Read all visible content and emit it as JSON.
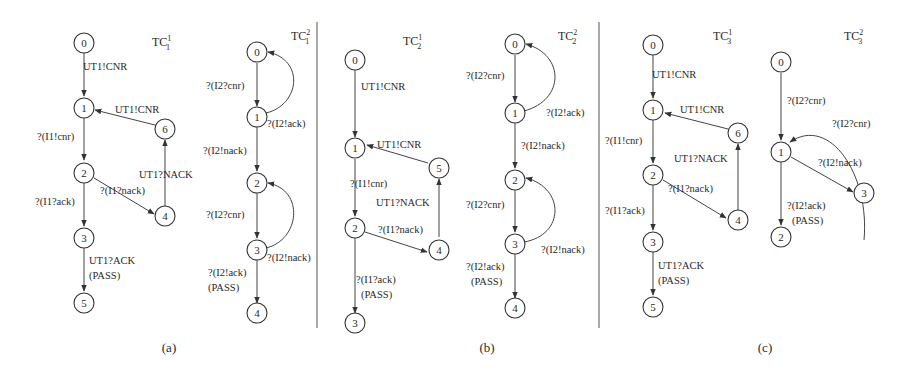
{
  "figure": {
    "panels": [
      {
        "id": "a",
        "caption": "(a)"
      },
      {
        "id": "b",
        "caption": "(b)"
      },
      {
        "id": "c",
        "caption": "(c)"
      }
    ],
    "graphs": {
      "tc11": {
        "title": "TC",
        "sup": "1",
        "sub": "1",
        "nodes": [
          "0",
          "1",
          "2",
          "3",
          "4",
          "5",
          "6"
        ],
        "edges": [
          {
            "from": "0",
            "to": "1",
            "label": "UT1!CNR"
          },
          {
            "from": "1",
            "to": "2",
            "label": "?(I1!cnr)"
          },
          {
            "from": "2",
            "to": "3",
            "label": "?(I1?ack)"
          },
          {
            "from": "2",
            "to": "4",
            "label": "?(I1?nack)"
          },
          {
            "from": "4",
            "to": "6",
            "label": "UT1?NACK"
          },
          {
            "from": "6",
            "to": "1",
            "label": "UT1!CNR"
          },
          {
            "from": "3",
            "to": "5",
            "label": "UT1?ACK",
            "label2": "(PASS)"
          }
        ]
      },
      "tc12": {
        "title": "TC",
        "sup": "2",
        "sub": "1",
        "nodes": [
          "0",
          "1",
          "2",
          "3",
          "4"
        ],
        "edges": [
          {
            "from": "0",
            "to": "1",
            "label": "?(I2?cnr)"
          },
          {
            "from": "1",
            "to": "0",
            "label": "?(I2!ack)"
          },
          {
            "from": "1",
            "to": "2",
            "label": "?(I2!nack)"
          },
          {
            "from": "2",
            "to": "3",
            "label": "?(I2?cnr)"
          },
          {
            "from": "3",
            "to": "2",
            "label": "?(I2!nack)"
          },
          {
            "from": "3",
            "to": "4",
            "label": "?(I2!ack)",
            "label2": "(PASS)"
          }
        ]
      },
      "tc21": {
        "title": "TC",
        "sup": "1",
        "sub": "2",
        "nodes": [
          "0",
          "1",
          "2",
          "3",
          "4",
          "5"
        ],
        "edges": [
          {
            "from": "0",
            "to": "1",
            "label": "UT1!CNR"
          },
          {
            "from": "1",
            "to": "2",
            "label": "?(I1!cnr)"
          },
          {
            "from": "2",
            "to": "4",
            "label": "?(I1?nack)"
          },
          {
            "from": "4",
            "to": "5",
            "label": "UT1?NACK"
          },
          {
            "from": "5",
            "to": "1",
            "label": "UT1!CNR"
          },
          {
            "from": "2",
            "to": "3",
            "label": "?(I1?ack)",
            "label2": "(PASS)"
          }
        ]
      },
      "tc22": {
        "title": "TC",
        "sup": "2",
        "sub": "2",
        "nodes": [
          "0",
          "1",
          "2",
          "3",
          "4"
        ],
        "edges": [
          {
            "from": "0",
            "to": "1",
            "label": "?(I2?cnr)"
          },
          {
            "from": "1",
            "to": "0",
            "label": "?(I2!ack)"
          },
          {
            "from": "1",
            "to": "2",
            "label": "?(I2!nack)"
          },
          {
            "from": "2",
            "to": "3",
            "label": "?(I2?cnr)"
          },
          {
            "from": "3",
            "to": "2",
            "label": "?(I2!nack)"
          },
          {
            "from": "3",
            "to": "4",
            "label": "?(I2!ack)",
            "label2": "(PASS)"
          }
        ]
      },
      "tc31": {
        "title": "TC",
        "sup": "1",
        "sub": "3",
        "nodes": [
          "0",
          "1",
          "2",
          "3",
          "4",
          "5",
          "6"
        ],
        "edges": [
          {
            "from": "0",
            "to": "1",
            "label": "UT1!CNR"
          },
          {
            "from": "1",
            "to": "2",
            "label": "?(I1!cnr)"
          },
          {
            "from": "2",
            "to": "3",
            "label": "?(I1?ack)"
          },
          {
            "from": "2",
            "to": "4",
            "label": "?(I1?nack)"
          },
          {
            "from": "4",
            "to": "6",
            "label": "UT1?NACK"
          },
          {
            "from": "6",
            "to": "1",
            "label": "UT1!CNR"
          },
          {
            "from": "3",
            "to": "5",
            "label": "UT1?ACK",
            "label2": "(PASS)"
          }
        ]
      },
      "tc32": {
        "title": "TC",
        "sup": "2",
        "sub": "3",
        "nodes": [
          "0",
          "1",
          "2",
          "3"
        ],
        "edges": [
          {
            "from": "0",
            "to": "1",
            "label": "?(I2?cnr)"
          },
          {
            "from": "3",
            "to": "1",
            "label": "?(I2?cnr)"
          },
          {
            "from": "1",
            "to": "3",
            "label": "?(I2!nack)"
          },
          {
            "from": "1",
            "to": "2",
            "label": "?(I2!ack)",
            "label2": "(PASS)"
          }
        ]
      }
    }
  }
}
